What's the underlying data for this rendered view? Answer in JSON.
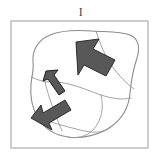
{
  "figure": {
    "panel_label": "I",
    "caption_position": "top-center",
    "background_color": "#ffffff"
  },
  "frame": {
    "name": "panel-border",
    "stroke_color": "#b9b9b9",
    "stroke_width": 1.4,
    "x": 11,
    "y": 21,
    "width": 137,
    "height": 127
  },
  "region": {
    "name": "blob-outline",
    "label": "irregular region",
    "stroke_color": "#8d8d8d",
    "stroke_width": 1.1,
    "fill": "#ffffff",
    "path": "M 33 62 C 32 50 38 40 50 35 C 62 30 78 30 92 31 C 106 32 120 31 130 35 C 139 39 140 48 137 58 C 133 70 131 82 130 93 C 129 105 124 117 112 126 C 100 135 82 139 68 137 C 54 135 44 128 38 118 C 32 108 30 95 31 84 C 32 75 34 69 33 62 Z"
  },
  "internal_lines": [
    {
      "name": "subdivision-line-upper",
      "stroke_color": "#9a9a9a",
      "stroke_width": 0.9,
      "path": "M 96 31 C 100 44 105 56 112 66 C 119 76 127 84 134 89"
    },
    {
      "name": "subdivision-line-diagonal",
      "stroke_color": "#9a9a9a",
      "stroke_width": 0.9,
      "path": "M 45 82 C 62 80 80 87 98 94 C 112 99 123 100 131 98"
    },
    {
      "name": "subdivision-line-left",
      "stroke_color": "#9a9a9a",
      "stroke_width": 0.9,
      "path": "M 31 77 C 36 79 41 81 45 82"
    },
    {
      "name": "subdivision-line-lower-left",
      "stroke_color": "#9a9a9a",
      "stroke_width": 0.9,
      "path": "M 45 82 C 48 95 54 112 62 131"
    },
    {
      "name": "subdivision-line-lower-right",
      "stroke_color": "#9a9a9a",
      "stroke_width": 0.9,
      "path": "M 101 95 C 104 108 102 120 93 130 C 86 137 76 139 68 137"
    },
    {
      "name": "subdivision-line-bottom",
      "stroke_color": "#9a9a9a",
      "stroke_width": 0.9,
      "path": "M 38 118 C 50 122 64 126 80 130 C 92 133 104 134 112 126"
    }
  ],
  "arrows": [
    {
      "name": "arrow-large-northwest",
      "direction": "northwest",
      "size": "large",
      "fill_color": "#585858",
      "stroke_color": "#2b2b2b",
      "stroke_width": 1.0,
      "points": "76,42 99,39 93,49 115,60 106,76 84,65 78,75"
    },
    {
      "name": "arrow-small-northwest",
      "direction": "northwest",
      "size": "small",
      "fill_color": "#585858",
      "stroke_color": "#1f1f1f",
      "stroke_width": 1.0,
      "points": "46,71 58,70 54,75 65,91 59,95 48,79 43,81"
    },
    {
      "name": "arrow-medium-southwest",
      "direction": "southwest",
      "size": "medium",
      "fill_color": "#585858",
      "stroke_color": "#2b2b2b",
      "stroke_width": 1.0,
      "points": "31,118 41,105 43,113 65,100 71,110 49,123 52,130"
    }
  ]
}
